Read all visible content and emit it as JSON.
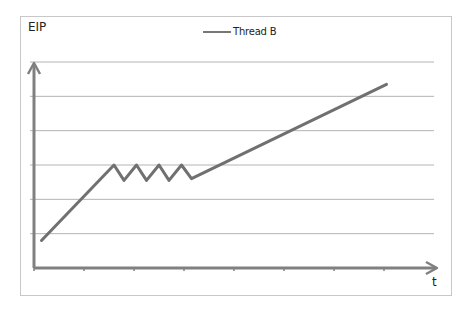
{
  "chart_data": {
    "type": "line",
    "title": "",
    "xlabel": "t",
    "ylabel": "EIP",
    "legend": {
      "position": "top-center",
      "entries": [
        "Thread B"
      ]
    },
    "grid": true,
    "y_gridlines": 6,
    "x_ticks": 8,
    "xlim": [
      0,
      8
    ],
    "ylim": [
      0,
      6
    ],
    "series": [
      {
        "name": "Thread B",
        "color": "#707070",
        "points": [
          [
            0.15,
            0.8
          ],
          [
            1.6,
            3.0
          ],
          [
            1.8,
            2.55
          ],
          [
            2.05,
            3.0
          ],
          [
            2.25,
            2.55
          ],
          [
            2.5,
            3.0
          ],
          [
            2.7,
            2.55
          ],
          [
            2.95,
            3.0
          ],
          [
            3.15,
            2.6
          ],
          [
            7.05,
            5.35
          ]
        ]
      }
    ],
    "annotations": [
      "Line rises, oscillates near a constant level (waiting/spinning), then rises again"
    ]
  },
  "labels": {
    "y_axis": "EIP",
    "x_axis": "t",
    "legend_item": "Thread B"
  },
  "colors": {
    "series": "#707070",
    "axis": "#808080",
    "grid": "#b4b4b4",
    "frame": "#c8c8c8"
  }
}
